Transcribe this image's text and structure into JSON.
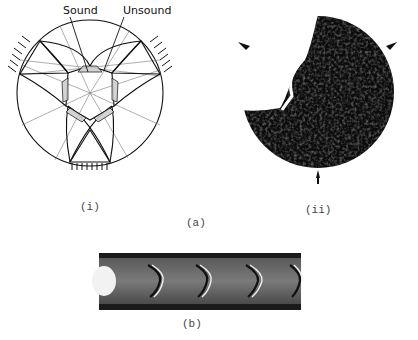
{
  "figure": {
    "panel_a": {
      "label": "(a)",
      "subpanel_i": {
        "label": "(i)",
        "annotations": {
          "sound": "Sound",
          "unsound": "Unsound"
        },
        "description": "Slip-line field diagram: circular disc under three-point loading with central hexagonal region"
      },
      "subpanel_ii": {
        "label": "(ii)",
        "description": "Etched photograph of disc showing dark deformation region with three loading arrows"
      }
    },
    "panel_b": {
      "label": "(b)",
      "description": "Strip showing sequence of chevron-shaped bands"
    }
  }
}
